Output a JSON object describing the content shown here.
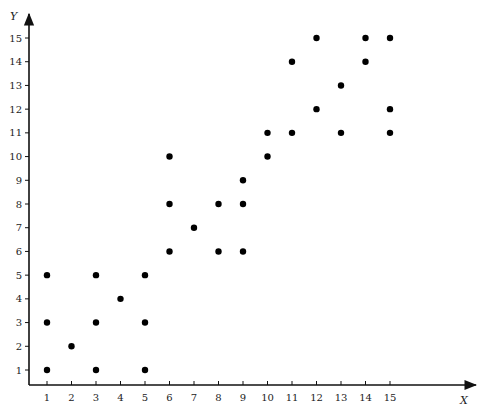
{
  "chart_data": {
    "type": "scatter",
    "title": "",
    "xlabel": "X",
    "ylabel": "Y",
    "xlim": [
      0,
      17
    ],
    "ylim": [
      0,
      16
    ],
    "grid": false,
    "legend": null,
    "x_ticks": [
      1,
      2,
      3,
      4,
      5,
      6,
      7,
      8,
      9,
      10,
      11,
      12,
      13,
      14,
      15
    ],
    "y_ticks": [
      1,
      2,
      3,
      4,
      5,
      6,
      7,
      8,
      9,
      10,
      11,
      12,
      13,
      14,
      15
    ],
    "marker_color": "#000000",
    "series": [
      {
        "name": "points",
        "points": [
          {
            "x": 1,
            "y": 1
          },
          {
            "x": 1,
            "y": 3
          },
          {
            "x": 1,
            "y": 5
          },
          {
            "x": 2,
            "y": 2
          },
          {
            "x": 3,
            "y": 1
          },
          {
            "x": 3,
            "y": 3
          },
          {
            "x": 3,
            "y": 5
          },
          {
            "x": 4,
            "y": 4
          },
          {
            "x": 5,
            "y": 1
          },
          {
            "x": 5,
            "y": 3
          },
          {
            "x": 5,
            "y": 5
          },
          {
            "x": 6,
            "y": 6
          },
          {
            "x": 6,
            "y": 8
          },
          {
            "x": 6,
            "y": 10
          },
          {
            "x": 7,
            "y": 7
          },
          {
            "x": 8,
            "y": 6
          },
          {
            "x": 8,
            "y": 8
          },
          {
            "x": 9,
            "y": 6
          },
          {
            "x": 9,
            "y": 8
          },
          {
            "x": 9,
            "y": 9
          },
          {
            "x": 10,
            "y": 10
          },
          {
            "x": 10,
            "y": 11
          },
          {
            "x": 11,
            "y": 11
          },
          {
            "x": 11,
            "y": 14
          },
          {
            "x": 12,
            "y": 12
          },
          {
            "x": 12,
            "y": 15
          },
          {
            "x": 13,
            "y": 11
          },
          {
            "x": 13,
            "y": 13
          },
          {
            "x": 14,
            "y": 14
          },
          {
            "x": 14,
            "y": 15
          },
          {
            "x": 15,
            "y": 11
          },
          {
            "x": 15,
            "y": 12
          },
          {
            "x": 15,
            "y": 15
          }
        ]
      }
    ]
  }
}
